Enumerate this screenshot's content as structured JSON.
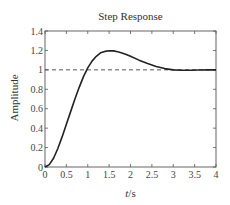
{
  "chart_data": {
    "type": "line",
    "title": "Step Response",
    "xlabel_italic": "t",
    "xlabel_unit": "/s",
    "xlabel": "t/s",
    "ylabel": "Amplitude",
    "xlim": [
      0,
      4
    ],
    "ylim": [
      0,
      1.4
    ],
    "xticks": [
      "0",
      "0.5",
      "1",
      "1.5",
      "2",
      "2.5",
      "3",
      "3.5",
      "4"
    ],
    "yticks": [
      "0",
      "0.2",
      "0.4",
      "0.6",
      "0.8",
      "1",
      "1.2",
      "1.4"
    ],
    "grid": false,
    "legend": null,
    "reference_line": {
      "y": 1.0,
      "style": "dashed"
    },
    "series": [
      {
        "name": "Step Response",
        "x": [
          0,
          0.1,
          0.2,
          0.3,
          0.4,
          0.5,
          0.6,
          0.7,
          0.8,
          0.9,
          1.0,
          1.1,
          1.2,
          1.3,
          1.4,
          1.5,
          1.6,
          1.7,
          1.8,
          1.9,
          2.0,
          2.2,
          2.4,
          2.6,
          2.8,
          3.0,
          3.2,
          3.4,
          3.6,
          3.8,
          4.0
        ],
        "values": [
          0,
          0.024,
          0.09,
          0.19,
          0.31,
          0.44,
          0.57,
          0.7,
          0.82,
          0.93,
          1.02,
          1.09,
          1.14,
          1.175,
          1.19,
          1.196,
          1.195,
          1.187,
          1.174,
          1.158,
          1.14,
          1.1,
          1.065,
          1.035,
          1.013,
          1.0,
          0.996,
          0.996,
          0.998,
          1.0,
          1.0
        ]
      }
    ]
  }
}
